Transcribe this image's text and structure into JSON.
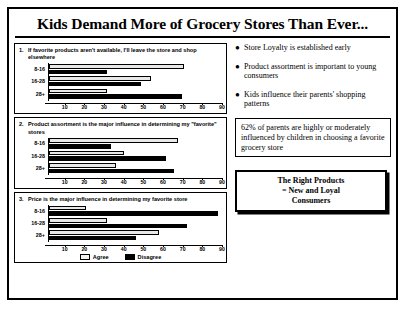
{
  "slide": {
    "title": "Kids Demand More of Grocery Stores Than Ever..."
  },
  "legend": {
    "agree_label": "Agree",
    "disagree_label": "Disagree"
  },
  "bullets": [
    {
      "text": "Store Loyalty is established early",
      "marker": "bullet-dot"
    },
    {
      "text": "Product assortment is important to young consumers",
      "marker": "bullet-dot"
    },
    {
      "text": "Kids influence their parents' shopping patterns",
      "marker": "bullet-dot"
    }
  ],
  "callout": {
    "text": "62% of parents are highly or moderately influenced by children in choosing a favorite grocery store"
  },
  "bottom_box": {
    "line1": "The Right Products",
    "line2": "= New and Loyal",
    "line3": "Consumers"
  },
  "chart_data": [
    {
      "type": "bar",
      "orientation": "horizontal",
      "number": "1.",
      "title": "If favorite products aren't available, I'll leave the store and shop elsewhere",
      "categories": [
        "8-16",
        "16-28",
        "28+"
      ],
      "series": [
        {
          "name": "Agree",
          "values": [
            70,
            53,
            30
          ]
        },
        {
          "name": "Disagree",
          "values": [
            30,
            48,
            69
          ]
        }
      ],
      "xlabel": "",
      "ylabel": "",
      "xlim": [
        0,
        90
      ],
      "xticks": [
        10,
        20,
        30,
        40,
        50,
        60,
        70,
        80,
        90
      ],
      "grid": false,
      "legend_position": "bottom"
    },
    {
      "type": "bar",
      "orientation": "horizontal",
      "number": "2.",
      "title": "Product assortment is the major influence in determining my \"favorite\" stores",
      "categories": [
        "8-16",
        "16-28",
        "28+"
      ],
      "series": [
        {
          "name": "Agree",
          "values": [
            67,
            39,
            35
          ]
        },
        {
          "name": "Disagree",
          "values": [
            32,
            61,
            65
          ]
        }
      ],
      "xlabel": "",
      "ylabel": "",
      "xlim": [
        0,
        90
      ],
      "xticks": [
        10,
        20,
        30,
        40,
        50,
        60,
        70,
        80,
        90
      ],
      "grid": false,
      "legend_position": "bottom"
    },
    {
      "type": "bar",
      "orientation": "horizontal",
      "number": "3.",
      "title": "Price is the major influence in determining my favorite store",
      "categories": [
        "8-16",
        "16-28",
        "28+"
      ],
      "series": [
        {
          "name": "Agree",
          "values": [
            19,
            30,
            57
          ]
        },
        {
          "name": "Disagree",
          "values": [
            88,
            72,
            45
          ]
        }
      ],
      "xlabel": "",
      "ylabel": "",
      "xlim": [
        0,
        90
      ],
      "xticks": [
        10,
        20,
        30,
        40,
        50,
        60,
        70,
        80,
        90
      ],
      "grid": false,
      "legend_position": "bottom"
    }
  ]
}
